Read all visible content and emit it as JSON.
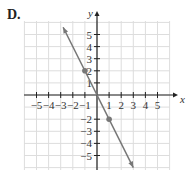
{
  "panel_label": "D.",
  "chart_data": {
    "type": "line",
    "title": "",
    "xlabel": "x",
    "ylabel": "y",
    "xlim": [
      -5.5,
      5.5
    ],
    "ylim": [
      -6,
      6
    ],
    "grid": true,
    "x_ticks": [
      -5,
      -4,
      -3,
      -2,
      -1,
      1,
      2,
      3,
      4,
      5
    ],
    "y_ticks": [
      5,
      4,
      3,
      2,
      1,
      -2,
      -3,
      -4,
      -5
    ],
    "x_tick_labels": [
      "−5",
      "−4",
      "−3",
      "−2",
      "−1",
      "1",
      "2",
      "3",
      "4",
      "5"
    ],
    "y_tick_labels": [
      "5",
      "4",
      "3",
      "2",
      "1",
      "−2",
      "−3",
      "−4",
      "−5"
    ],
    "series": [
      {
        "name": "y = -2x",
        "equation": "y = -2x",
        "slope": -2,
        "intercept": 0,
        "endpoints_with_arrows": [
          [
            -2.8,
            5.6
          ],
          [
            3,
            -6
          ]
        ],
        "marked_points": [
          [
            -1,
            2
          ],
          [
            1,
            -2
          ]
        ]
      }
    ],
    "colors": {
      "line": "#777777",
      "grid": "#dddddd",
      "axis": "#222222"
    }
  }
}
